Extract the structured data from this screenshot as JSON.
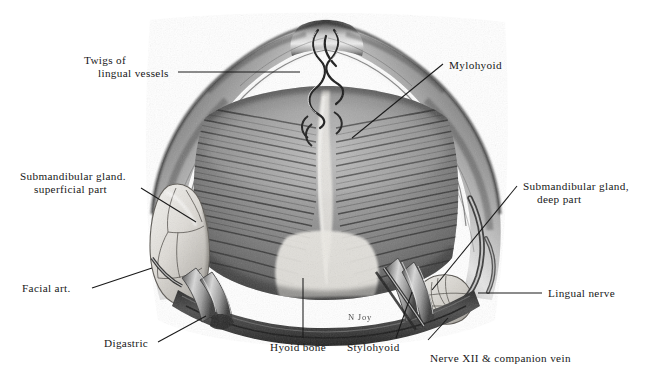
{
  "plate": {
    "kind": "anatomical-illustration",
    "subject": "Floor of the mouth dissection, inferior view of mandible and mylohyoid",
    "background_color": "#ffffff",
    "ink_color": "#171717",
    "artist_signature": "N Joy"
  },
  "labels": [
    {
      "id": "twigs-of-lingual-vessels",
      "line1": "Twigs of",
      "line2": "lingual vessels"
    },
    {
      "id": "mylohyoid",
      "line1": "Mylohyoid",
      "line2": ""
    },
    {
      "id": "submandibular-gland-superficial-part",
      "line1": "Submandibular gland.",
      "line2": "superficial part"
    },
    {
      "id": "submandibular-gland-deep-part",
      "line1": "Submandibular gland,",
      "line2": "deep part"
    },
    {
      "id": "facial-art",
      "line1": "Facial art.",
      "line2": ""
    },
    {
      "id": "lingual-nerve",
      "line1": "Lingual nerve",
      "line2": ""
    },
    {
      "id": "digastric",
      "line1": "Digastric",
      "line2": ""
    },
    {
      "id": "hyoid-bone",
      "line1": "Hyoid bone",
      "line2": ""
    },
    {
      "id": "stylohyoid",
      "line1": "Stylohyoid",
      "line2": ""
    },
    {
      "id": "nerve-xii-companion-vein",
      "line1": "Nerve XII & companion vein",
      "line2": ""
    }
  ]
}
